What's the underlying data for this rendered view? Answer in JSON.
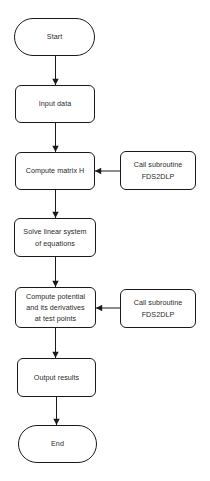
{
  "diagram": {
    "background_color": "#ffffff",
    "line_color": "#1a1a1a",
    "text_color": "#2b2b2b",
    "nodes": [
      {
        "id": "start",
        "label": "Start",
        "shape": "terminal",
        "x": 14,
        "y": 18,
        "w": 81,
        "h": 38
      },
      {
        "id": "input",
        "label": "Input data",
        "shape": "process",
        "x": 15,
        "y": 85,
        "w": 80,
        "h": 38
      },
      {
        "id": "matrix",
        "label": "Compute matrix H",
        "shape": "process",
        "x": 15,
        "y": 152,
        "w": 80,
        "h": 38
      },
      {
        "id": "sub1",
        "label": "Call subroutine\nFDS2DLP",
        "shape": "process",
        "x": 120,
        "y": 151,
        "w": 76,
        "h": 39
      },
      {
        "id": "solve",
        "label": "Solve linear system\nof equations",
        "shape": "process",
        "x": 14,
        "y": 218,
        "w": 82,
        "h": 39
      },
      {
        "id": "potential",
        "label": "Compute potential\nand its derivatives\nat test points",
        "shape": "process",
        "x": 15,
        "y": 287,
        "w": 81,
        "h": 41
      },
      {
        "id": "sub2",
        "label": "Call subroutine\nFDS2DLP",
        "shape": "process",
        "x": 120,
        "y": 289,
        "w": 76,
        "h": 39
      },
      {
        "id": "output",
        "label": "Output results",
        "shape": "process",
        "x": 17,
        "y": 358,
        "w": 79,
        "h": 39
      },
      {
        "id": "end",
        "label": "End",
        "shape": "terminal",
        "x": 18,
        "y": 425,
        "w": 79,
        "h": 38
      }
    ],
    "edges": [
      {
        "id": "start-input",
        "from": "start",
        "to": "input",
        "direction": "down",
        "x1": 55.5,
        "y1": 56,
        "x2": 55.5,
        "y2": 85
      },
      {
        "id": "input-matrix",
        "from": "input",
        "to": "matrix",
        "direction": "down",
        "x1": 55.5,
        "y1": 123,
        "x2": 55.5,
        "y2": 152
      },
      {
        "id": "sub1-matrix",
        "from": "sub1",
        "to": "matrix",
        "direction": "left",
        "x1": 120,
        "y1": 171,
        "x2": 95,
        "y2": 171
      },
      {
        "id": "matrix-solve",
        "from": "matrix",
        "to": "solve",
        "direction": "down",
        "x1": 55.5,
        "y1": 190,
        "x2": 55.5,
        "y2": 218
      },
      {
        "id": "solve-potential",
        "from": "solve",
        "to": "potential",
        "direction": "down",
        "x1": 55.5,
        "y1": 257,
        "x2": 55.5,
        "y2": 287
      },
      {
        "id": "sub2-potential",
        "from": "sub2",
        "to": "potential",
        "direction": "left",
        "x1": 120,
        "y1": 308,
        "x2": 96,
        "y2": 308
      },
      {
        "id": "potential-output",
        "from": "potential",
        "to": "output",
        "direction": "down",
        "x1": 55.5,
        "y1": 328,
        "x2": 55.5,
        "y2": 358
      },
      {
        "id": "output-end",
        "from": "output",
        "to": "end",
        "direction": "down",
        "x1": 56.5,
        "y1": 397,
        "x2": 56.5,
        "y2": 425
      }
    ]
  }
}
